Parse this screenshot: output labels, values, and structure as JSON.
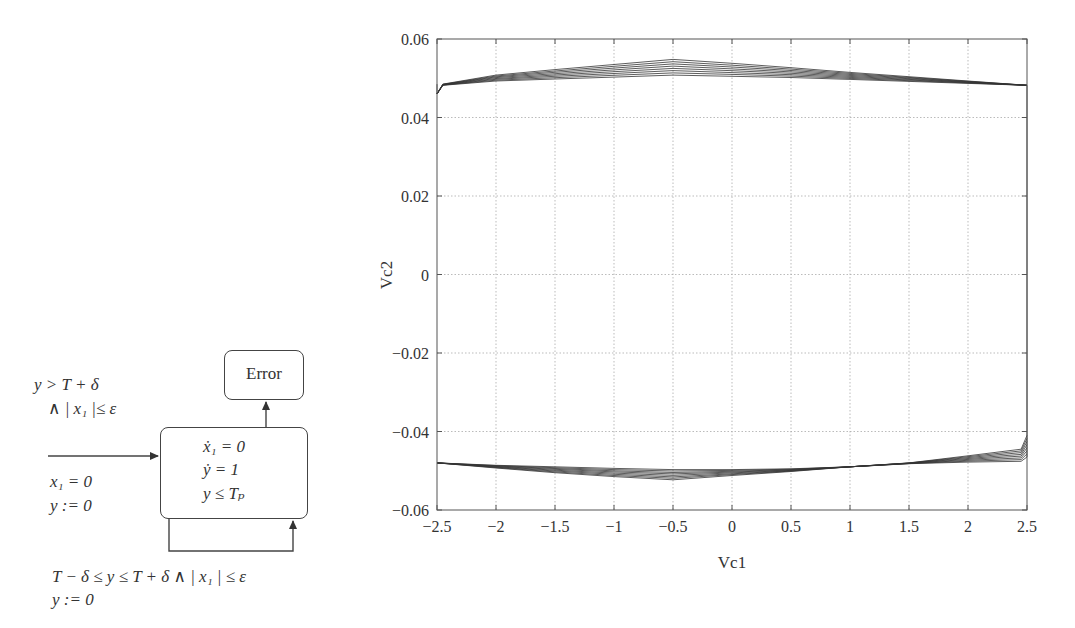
{
  "automaton": {
    "error_state": "Error",
    "main_state": {
      "flow_x1": "ẋ₁ = 0",
      "flow_y": "ẏ = 1",
      "invariant": "y ≤ Tₚ"
    },
    "error_guard_line1": "y > T + δ",
    "error_guard_line2": "∧ | x₁ |≤ ε",
    "init_line1": "x₁ = 0",
    "init_line2": "y := 0",
    "loop_guard": "T − δ ≤ y ≤ T + δ ∧  | x₁ | ≤ ε",
    "loop_reset": "y := 0"
  },
  "chart_data": {
    "type": "line",
    "title": "",
    "xlabel": "Vc1",
    "ylabel": "Vc2",
    "xlim": [
      -2.5,
      2.5
    ],
    "ylim": [
      -0.06,
      0.06
    ],
    "grid": true,
    "legend": null,
    "x_ticks": [
      "−2.5",
      "−2",
      "−1.5",
      "−1",
      "−0.5",
      "0",
      "0.5",
      "1",
      "1.5",
      "2",
      "2.5"
    ],
    "y_ticks": [
      "0.06",
      "0.04",
      "0.02",
      "0",
      "−0.02",
      "−0.04",
      "−0.06"
    ],
    "series": [
      {
        "name": "upper branch envelope (outer)",
        "x": [
          -2.5,
          -2.45,
          -2.0,
          -1.5,
          -1.0,
          -0.5,
          0.0,
          0.5,
          1.0,
          1.5,
          2.0,
          2.5
        ],
        "y": [
          0.046,
          0.0485,
          0.0508,
          0.0522,
          0.0535,
          0.0548,
          0.0538,
          0.0527,
          0.0515,
          0.0504,
          0.0493,
          0.0482
        ]
      },
      {
        "name": "upper branch envelope (inner)",
        "x": [
          -2.5,
          -2.45,
          -2.0,
          -1.5,
          -1.0,
          -0.5,
          0.0,
          0.5,
          1.0,
          1.5,
          2.0,
          2.5
        ],
        "y": [
          0.046,
          0.0482,
          0.0493,
          0.0498,
          0.0503,
          0.0508,
          0.0505,
          0.0502,
          0.0497,
          0.0492,
          0.0487,
          0.0482
        ]
      },
      {
        "name": "lower branch envelope (outer)",
        "x": [
          -2.5,
          -2.0,
          -1.5,
          -1.0,
          -0.5,
          0.0,
          0.5,
          1.0,
          1.5,
          2.0,
          2.45,
          2.5
        ],
        "y": [
          -0.048,
          -0.0493,
          -0.0505,
          -0.0515,
          -0.0523,
          -0.0512,
          -0.0502,
          -0.049,
          -0.048,
          -0.0462,
          -0.0445,
          -0.041
        ]
      },
      {
        "name": "lower branch envelope (inner)",
        "x": [
          -2.5,
          -2.0,
          -1.5,
          -1.0,
          -0.5,
          0.0,
          0.5,
          1.0,
          1.5,
          2.0,
          2.45,
          2.5
        ],
        "y": [
          -0.048,
          -0.0486,
          -0.049,
          -0.0494,
          -0.0497,
          -0.0497,
          -0.0495,
          -0.049,
          -0.0482,
          -0.0478,
          -0.0476,
          -0.0465
        ]
      }
    ]
  }
}
